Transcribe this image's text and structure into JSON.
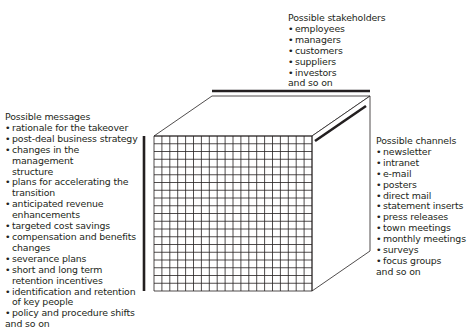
{
  "stakeholders": {
    "title": "Possible stakeholders",
    "items": [
      "employees",
      "managers",
      "customers",
      "suppliers",
      "investors"
    ],
    "tail": "and so on"
  },
  "messages": {
    "title": "Possible messages",
    "items": [
      "rationale for the takeover",
      "post-deal business strategy",
      "changes in the management structure",
      "plans for accelerating the transition",
      "anticipated revenue enhancements",
      "targeted cost savings",
      "compensation and benefits changes",
      "severance plans",
      "short and long term retention incentives",
      "identification and retention of key people",
      "policy and procedure shifts"
    ],
    "tail": "and so on"
  },
  "channels": {
    "title": "Possible channels",
    "items": [
      "newsletter",
      "intranet",
      "e-mail",
      "posters",
      "direct mail",
      "statement inserts",
      "press releases",
      "town meetings",
      "monthly meetings",
      "surveys",
      "focus groups"
    ],
    "tail": "and so on"
  },
  "cube": {
    "grid_columns": 20,
    "grid_rows": 20,
    "line_color": "#231f20",
    "accent_bar_color": "#231f20"
  }
}
